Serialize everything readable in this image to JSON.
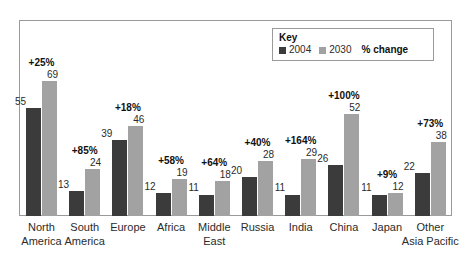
{
  "legend": {
    "title": "Key",
    "series_2004_label": "2004",
    "series_2030_label": "2030",
    "pct_change_label": "% change",
    "color_2004": "#3b3b3b",
    "color_2030": "#a2a2a2"
  },
  "chart_data": {
    "type": "bar",
    "title": "",
    "xlabel": "",
    "ylabel": "",
    "ylim": [
      0,
      75
    ],
    "grid": false,
    "legend_position": "top-right",
    "categories": [
      "North America",
      "South America",
      "Europe",
      "Africa",
      "Middle East",
      "Russia",
      "India",
      "China",
      "Japan",
      "Other Asia Pacific"
    ],
    "category_lines": [
      [
        "North",
        "America"
      ],
      [
        "South",
        "America"
      ],
      [
        "Europe"
      ],
      [
        "Africa"
      ],
      [
        "Middle",
        "East"
      ],
      [
        "Russia"
      ],
      [
        "India"
      ],
      [
        "China"
      ],
      [
        "Japan"
      ],
      [
        "Other",
        "Asia Pacific"
      ]
    ],
    "series": [
      {
        "name": "2004",
        "values": [
          55,
          13,
          39,
          12,
          11,
          20,
          11,
          26,
          11,
          22
        ]
      },
      {
        "name": "2030",
        "values": [
          69,
          24,
          46,
          19,
          18,
          28,
          29,
          52,
          12,
          38
        ]
      }
    ],
    "annotations": {
      "name": "% change",
      "values": [
        "+25%",
        "+85%",
        "+18%",
        "+58%",
        "+64%",
        "+40%",
        "+164%",
        "+100%",
        "+9%",
        "+73%"
      ]
    }
  }
}
